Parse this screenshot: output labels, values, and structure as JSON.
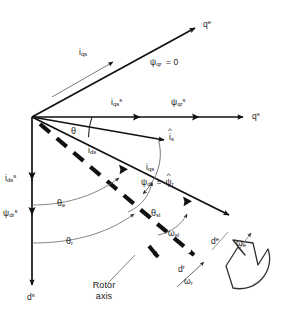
{
  "diagram": {
    "background_color": "#ffffff",
    "stroke_color": "#111111",
    "text_color": "#1a1a1a",
    "width": 281,
    "height": 311
  },
  "axes": {
    "qe_label": "q",
    "qe_sup": "e",
    "qs_label": "q",
    "qs_sup": "s",
    "ds_label": "d",
    "ds_sup": "s",
    "de_label": "d",
    "de_sup": "e",
    "dr_label": "d",
    "dr_sup": "r"
  },
  "vectors": {
    "iqs_label": "i",
    "iqs_sub": "qs",
    "iqs_s_label": "i",
    "iqs_s_sub": "qs",
    "iqs_s_sup": "s",
    "ids_label": "i",
    "ids_sub": "ds",
    "ids_s_label": "i",
    "ids_s_sub": "ds",
    "ids_s_sup": "s",
    "is_hat_label": "i",
    "is_hat_sub": "s",
    "is_hat_mark": "^",
    "psi_qr_eq": "= 0",
    "psi_qr_label": "ψ",
    "psi_qr_sub": "qr",
    "psi_qr_s_label": "ψ",
    "psi_qr_s_sub": "qr",
    "psi_qr_s_sup": "s",
    "psi_dr_s_label": "ψ",
    "psi_dr_s_sub": "dr",
    "psi_dr_s_sup": "s",
    "psi_dr_label": "ψ",
    "psi_dr_sub": "dr",
    "psi_dr_eq": "=",
    "psi_r_hat_label": "ψ",
    "psi_r_hat_sub": "r",
    "psi_r_hat_mark": "^"
  },
  "angles": {
    "theta": "θ",
    "theta_e": "θ",
    "theta_e_sub": "e",
    "theta_r": "θ",
    "theta_r_sub": "r",
    "theta_sl": "θ",
    "theta_sl_sub": "sl"
  },
  "speeds": {
    "omega_sl": "ω",
    "omega_sl_sub": "sl",
    "omega_e": "ω",
    "omega_e_sub": "e",
    "omega_r": "ω",
    "omega_r_sub": "r"
  },
  "annotations": {
    "rotor_axis_line1": "Rotor",
    "rotor_axis_line2": "axis"
  }
}
